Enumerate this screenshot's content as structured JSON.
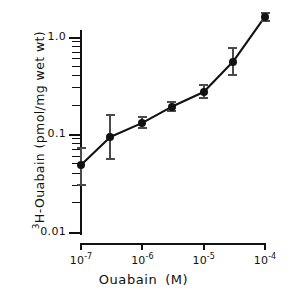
{
  "chart_data": {
    "type": "line",
    "title": "",
    "xlabel": "Ouabain  (M)",
    "ylabel": "3H-Ouabain  (pmol/mg wet wt)",
    "ylabel_superscript": "3",
    "ylabel_rest": "H-Ouabain  (pmol/mg wet wt)",
    "xscale": "log",
    "yscale": "log",
    "xlim": [
      1e-07,
      0.0001
    ],
    "ylim": [
      0.01,
      2.0
    ],
    "grid": false,
    "legend": null,
    "x": [
      1e-07,
      3e-07,
      1e-06,
      3e-06,
      1e-05,
      3e-05,
      0.0001
    ],
    "values": [
      0.048,
      0.093,
      0.13,
      0.19,
      0.27,
      0.55,
      1.6
    ],
    "error_low": [
      0.03,
      0.055,
      0.115,
      0.172,
      0.235,
      0.4,
      1.45
    ],
    "error_high": [
      0.072,
      0.155,
      0.15,
      0.215,
      0.315,
      0.76,
      1.75
    ],
    "marker": "filled-circle",
    "line_color": "#111111",
    "marker_color": "#111111",
    "error_color": "#4a4a4a",
    "xticks": [
      {
        "value": 1e-07,
        "mantissa": "10",
        "exponent": "-7"
      },
      {
        "value": 1e-06,
        "mantissa": "10",
        "exponent": "-6"
      },
      {
        "value": 1e-05,
        "mantissa": "10",
        "exponent": "-5"
      },
      {
        "value": 0.0001,
        "mantissa": "10",
        "exponent": "-4"
      }
    ],
    "yticks_major": [
      {
        "value": 0.01,
        "label": "0.01"
      },
      {
        "value": 0.1,
        "label": "0.1"
      },
      {
        "value": 1.0,
        "label": "1.0"
      }
    ],
    "yticks_minor": [
      0.02,
      0.03,
      0.04,
      0.05,
      0.06,
      0.07,
      0.08,
      0.09,
      0.2,
      0.3,
      0.4,
      0.5,
      0.6,
      0.7,
      0.8,
      0.9,
      2.0
    ]
  },
  "axes": {
    "x_title": "Ouabain  (M)",
    "y_title_sup": "3",
    "y_title_main": "H-Ouabain  (pmol/mg wet wt)"
  }
}
